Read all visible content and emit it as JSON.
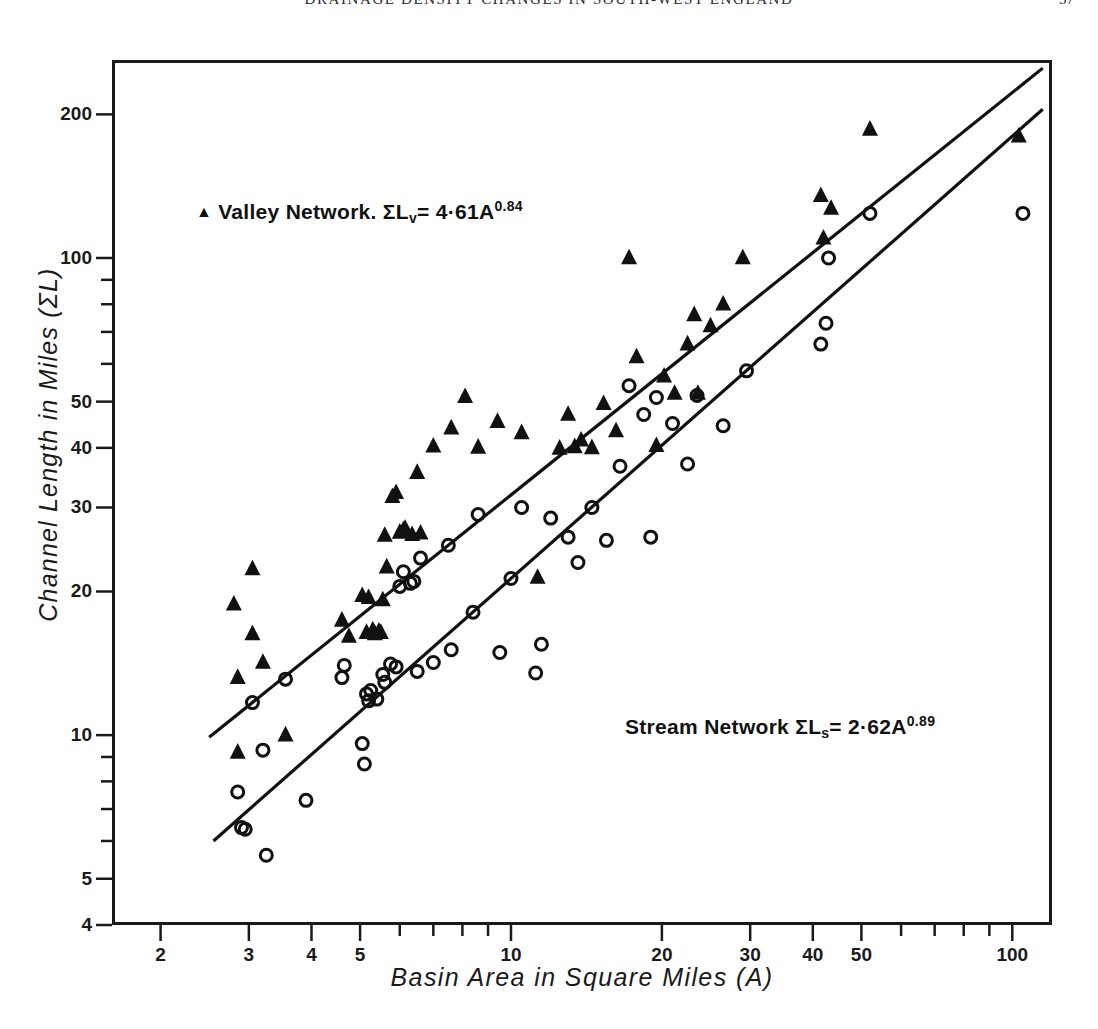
{
  "page": {
    "running_head": "DRAINAGE DENSITY CHANGES IN SOUTH-WEST ENGLAND",
    "page_number": "57"
  },
  "chart_data": {
    "type": "scatter",
    "title": "",
    "xlabel": "Basin  Area  in  Square  Miles  (A)",
    "ylabel": "Channel  Length  in  Miles  (ΣL)",
    "xscale": "log",
    "yscale": "log",
    "xlim": [
      1.6,
      120
    ],
    "ylim": [
      4,
      260
    ],
    "grid": false,
    "legend_position": "inside",
    "xticks": [
      2,
      3,
      4,
      5,
      6,
      7,
      8,
      9,
      10,
      20,
      30,
      40,
      50,
      60,
      70,
      80,
      90,
      100
    ],
    "xtick_labels": [
      "2",
      "3",
      "4",
      "5",
      "",
      "",
      "",
      "",
      "10",
      "20",
      "30",
      "40",
      "50",
      "",
      "",
      "",
      "",
      "100"
    ],
    "yticks": [
      4,
      5,
      6,
      7,
      8,
      9,
      10,
      20,
      30,
      40,
      50,
      60,
      70,
      80,
      90,
      100,
      200
    ],
    "ytick_labels": [
      "4",
      "5",
      "",
      "",
      "",
      "",
      "10",
      "20",
      "30",
      "40",
      "50",
      "",
      "",
      "",
      "",
      "100",
      "200"
    ],
    "annotations": [
      {
        "id": "valley-legend",
        "marker": "▲",
        "text": "Valley  Network.",
        "symbol": "ΣL",
        "subscript": "v",
        "equals": "= 4·61A",
        "exponent": "0.84"
      },
      {
        "id": "stream-legend",
        "marker": "",
        "text": "Stream  Network",
        "symbol": "ΣL",
        "subscript": "s",
        "equals": "= 2·62A",
        "exponent": "0.89"
      }
    ],
    "series": [
      {
        "name": "Valley Network",
        "marker": "triangle",
        "equation": "ΣLv = 4.61 A^0.84",
        "coefficient": 4.61,
        "exponent": 0.84,
        "fit_line": {
          "x": [
            2.5,
            115
          ],
          "y": [
            9.9,
            250
          ]
        },
        "points": [
          [
            2.8,
            18.8
          ],
          [
            2.85,
            13.2
          ],
          [
            2.85,
            9.2
          ],
          [
            3.05,
            16.3
          ],
          [
            3.05,
            22.3
          ],
          [
            3.2,
            14.2
          ],
          [
            3.55,
            10.0
          ],
          [
            4.6,
            17.4
          ],
          [
            4.75,
            16.1
          ],
          [
            5.05,
            19.6
          ],
          [
            5.15,
            16.4
          ],
          [
            5.2,
            19.4
          ],
          [
            5.3,
            16.6
          ],
          [
            5.35,
            16.3
          ],
          [
            5.45,
            16.5
          ],
          [
            5.5,
            16.4
          ],
          [
            5.55,
            19.2
          ],
          [
            5.6,
            26.2
          ],
          [
            5.65,
            22.5
          ],
          [
            5.8,
            31.6
          ],
          [
            5.9,
            32.2
          ],
          [
            6.0,
            26.6
          ],
          [
            6.1,
            26.9
          ],
          [
            6.15,
            27.1
          ],
          [
            6.35,
            26.3
          ],
          [
            6.5,
            35.5
          ],
          [
            6.6,
            26.5
          ],
          [
            7.0,
            40.3
          ],
          [
            7.6,
            44.0
          ],
          [
            8.1,
            51.2
          ],
          [
            8.6,
            40.1
          ],
          [
            9.4,
            45.4
          ],
          [
            10.5,
            43.0
          ],
          [
            11.3,
            21.4
          ],
          [
            12.5,
            39.9
          ],
          [
            13.0,
            47.0
          ],
          [
            13.4,
            40.2
          ],
          [
            13.8,
            41.5
          ],
          [
            14.5,
            40.0
          ],
          [
            15.3,
            49.5
          ],
          [
            16.2,
            43.4
          ],
          [
            17.2,
            100.0
          ],
          [
            17.8,
            62.0
          ],
          [
            19.5,
            40.4
          ],
          [
            20.2,
            56.5
          ],
          [
            21.2,
            52.0
          ],
          [
            22.5,
            66.0
          ],
          [
            23.2,
            76.0
          ],
          [
            23.6,
            52.0
          ],
          [
            25.0,
            72.0
          ],
          [
            26.5,
            80.0
          ],
          [
            29.0,
            100.0
          ],
          [
            41.5,
            135.0
          ],
          [
            42.0,
            110.0
          ],
          [
            43.5,
            127.0
          ],
          [
            52.0,
            186.0
          ],
          [
            103.0,
            180.0
          ]
        ]
      },
      {
        "name": "Stream Network",
        "marker": "circle",
        "equation": "ΣLs = 2.62 A^0.89",
        "coefficient": 2.62,
        "exponent": 0.89,
        "fit_line": {
          "x": [
            2.55,
            115
          ],
          "y": [
            6.0,
            205
          ]
        },
        "points": [
          [
            2.85,
            7.6
          ],
          [
            2.9,
            6.4
          ],
          [
            2.95,
            6.35
          ],
          [
            3.05,
            11.7
          ],
          [
            3.2,
            9.3
          ],
          [
            3.25,
            5.6
          ],
          [
            3.55,
            13.1
          ],
          [
            3.9,
            7.3
          ],
          [
            4.6,
            13.2
          ],
          [
            4.65,
            14.0
          ],
          [
            5.05,
            9.6
          ],
          [
            5.1,
            8.7
          ],
          [
            5.15,
            12.2
          ],
          [
            5.2,
            11.8
          ],
          [
            5.25,
            12.4
          ],
          [
            5.4,
            11.9
          ],
          [
            5.55,
            13.4
          ],
          [
            5.6,
            12.9
          ],
          [
            5.75,
            14.1
          ],
          [
            5.9,
            13.9
          ],
          [
            6.0,
            20.5
          ],
          [
            6.1,
            22.0
          ],
          [
            6.3,
            20.8
          ],
          [
            6.4,
            21.0
          ],
          [
            6.5,
            13.6
          ],
          [
            6.6,
            23.5
          ],
          [
            7.0,
            14.2
          ],
          [
            7.5,
            25.0
          ],
          [
            7.6,
            15.1
          ],
          [
            8.4,
            18.1
          ],
          [
            8.6,
            29.0
          ],
          [
            9.5,
            14.9
          ],
          [
            10.0,
            21.3
          ],
          [
            10.5,
            30.0
          ],
          [
            11.2,
            13.5
          ],
          [
            11.5,
            15.5
          ],
          [
            12.0,
            28.5
          ],
          [
            13.0,
            26.0
          ],
          [
            13.6,
            23.0
          ],
          [
            14.5,
            30.0
          ],
          [
            15.5,
            25.6
          ],
          [
            16.5,
            36.6
          ],
          [
            17.2,
            54.0
          ],
          [
            18.4,
            47.0
          ],
          [
            19.0,
            26.0
          ],
          [
            19.5,
            51.0
          ],
          [
            21.0,
            45.0
          ],
          [
            22.5,
            37.0
          ],
          [
            23.5,
            51.5
          ],
          [
            26.5,
            44.5
          ],
          [
            29.5,
            58.0
          ],
          [
            41.5,
            66.0
          ],
          [
            42.5,
            73.0
          ],
          [
            43.0,
            100.0
          ],
          [
            52.0,
            124.0
          ],
          [
            105.0,
            124.0
          ]
        ]
      }
    ]
  }
}
